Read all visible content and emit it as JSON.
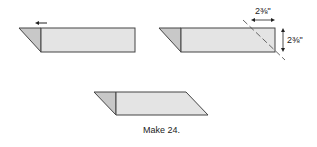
{
  "diagram": {
    "steps": [
      {
        "id": "step-1",
        "description": "strip with folded triangle, arrow pointing left"
      },
      {
        "id": "step-2",
        "description": "strip with dashed cut line and dimensions"
      },
      {
        "id": "step-3",
        "description": "finished parallelogram unit"
      }
    ],
    "dimensions": {
      "width_label": "2⅜\"",
      "height_label": "2⅜\""
    },
    "caption": "Make 24.",
    "colors": {
      "fabric_light": "#e4e4e4",
      "fabric_dark": "#c8c8c8",
      "outline": "#444444"
    }
  }
}
